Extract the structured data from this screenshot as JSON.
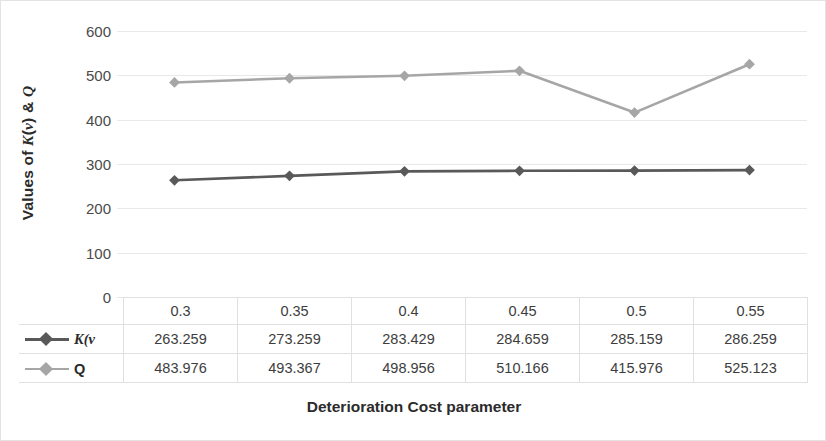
{
  "chart_data": {
    "type": "line",
    "title": "",
    "xlabel": "Deterioration Cost parameter",
    "ylabel": "Values of K(v) & Q",
    "ylabel_parts": {
      "prefix": "Values of ",
      "sym1": "K",
      "mid": "(",
      "sym2": "v",
      "close": ") & ",
      "sym3": "Q"
    },
    "categories": [
      "0.3",
      "0.35",
      "0.4",
      "0.45",
      "0.5",
      "0.55"
    ],
    "series": [
      {
        "name": "K(v",
        "name_italic_prefix": "K",
        "name_italic_suffix": "(v",
        "color": "#595959",
        "values": [
          263.259,
          273.259,
          283.429,
          284.659,
          285.159,
          286.259
        ],
        "labels": [
          "263.259",
          "273.259",
          "283.429",
          "284.659",
          "285.159",
          "286.259"
        ]
      },
      {
        "name": "Q",
        "color": "#a6a6a6",
        "values": [
          483.976,
          493.367,
          498.956,
          510.166,
          415.976,
          525.123
        ],
        "labels": [
          "483.976",
          "493.367",
          "498.956",
          "510.166",
          "415.976",
          "525.123"
        ]
      }
    ],
    "ylim": [
      0,
      600
    ],
    "yticks": [
      0,
      100,
      200,
      300,
      400,
      500,
      600
    ],
    "ytick_labels": [
      "0",
      "100",
      "200",
      "300",
      "400",
      "500",
      "600"
    ],
    "grid": true,
    "grid_color": "#e8e8e8",
    "legend_position": "data-table-left",
    "marker": "diamond",
    "has_data_table": true
  }
}
